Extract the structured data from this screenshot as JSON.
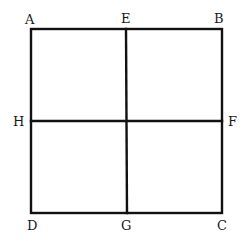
{
  "diagram": {
    "type": "geometry",
    "line_color": "#111111",
    "background": "#ffffff",
    "points": {
      "A": {
        "label": "A",
        "x": 31,
        "y": 29
      },
      "B": {
        "label": "B",
        "x": 222,
        "y": 29
      },
      "C": {
        "label": "C",
        "x": 222,
        "y": 213
      },
      "D": {
        "label": "D",
        "x": 32,
        "y": 213
      },
      "E": {
        "label": "E",
        "x": 126,
        "y": 29
      },
      "F": {
        "label": "F",
        "x": 222,
        "y": 121
      },
      "G": {
        "label": "G",
        "x": 127,
        "y": 213
      },
      "H": {
        "label": "H",
        "x": 31,
        "y": 121
      }
    },
    "segments": [
      "AB",
      "BC",
      "CD",
      "DA",
      "EG",
      "HF"
    ],
    "labels": {
      "A": "A",
      "B": "B",
      "C": "C",
      "D": "D",
      "E": "E",
      "F": "F",
      "G": "G",
      "H": "H"
    }
  }
}
